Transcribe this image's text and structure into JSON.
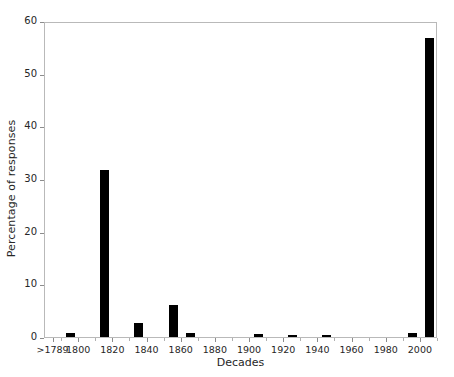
{
  "chart_data": {
    "type": "bar",
    "title": "",
    "xlabel": "Decades",
    "ylabel": "Percentage of responses",
    "ylim": [
      0,
      60
    ],
    "yticks": [
      0,
      10,
      20,
      30,
      40,
      50,
      60
    ],
    "ytick_labels": [
      "0",
      "10",
      "20",
      "30",
      "40",
      "50",
      "60"
    ],
    "xlim": [
      1780,
      2010
    ],
    "xtick_labels": [
      ">1789",
      "1800",
      "1820",
      "1840",
      "1860",
      "1880",
      "1900",
      "1920",
      "1940",
      "1960",
      "1980",
      "2000"
    ],
    "xtick_values": [
      1785,
      1800,
      1820,
      1840,
      1860,
      1880,
      1900,
      1920,
      1940,
      1960,
      1980,
      2000
    ],
    "grid": false,
    "legend": null,
    "bar_color": "#000000",
    "frame_color": "#b9b9b9",
    "categories": [
      "1790",
      "1810",
      "1820",
      "1830",
      "1850",
      "1860",
      "1900",
      "1920",
      "1940",
      "1990",
      "2000"
    ],
    "values": [
      0.7,
      31.8,
      2.6,
      6.1,
      6.1,
      0.8,
      0.5,
      0.4,
      0.4,
      0.7,
      56.7
    ],
    "bars": [
      {
        "decade": 1790,
        "label": "1790s",
        "value": 0.7
      },
      {
        "decade": 1810,
        "label": "1810s",
        "value": 31.8
      },
      {
        "decade": 1830,
        "label": "1830s",
        "value": 2.6
      },
      {
        "decade": 1850,
        "label": "1850s",
        "value": 6.1
      },
      {
        "decade": 1860,
        "label": "1860s",
        "value": 0.8
      },
      {
        "decade": 1900,
        "label": "1900s",
        "value": 0.5
      },
      {
        "decade": 1920,
        "label": "1920s",
        "value": 0.4
      },
      {
        "decade": 1940,
        "label": "1940s",
        "value": 0.4
      },
      {
        "decade": 1990,
        "label": "1990s",
        "value": 0.7
      },
      {
        "decade": 2000,
        "label": "2000s",
        "value": 56.7
      }
    ]
  }
}
